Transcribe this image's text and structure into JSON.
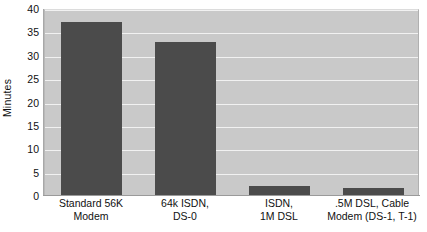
{
  "chart_data": {
    "type": "bar",
    "title": "",
    "xlabel": "",
    "ylabel": "Minutes",
    "ylim": [
      0,
      40
    ],
    "ytick_step": 5,
    "yticks": [
      40,
      35,
      30,
      25,
      20,
      15,
      10,
      5,
      0
    ],
    "grid": true,
    "legend": "none",
    "categories": [
      "Standard 56K Modem",
      "64k ISDN, DS-0",
      "ISDN, 1M DSL",
      ".5M DSL, Cable Modem (DS-1, T-1)"
    ],
    "category_lines": [
      [
        "Standard 56K",
        "Modem"
      ],
      [
        "64k ISDN,",
        "DS-0"
      ],
      [
        "ISDN,",
        "1M DSL"
      ],
      [
        ".5M DSL, Cable",
        "Modem (DS-1, T-1)"
      ]
    ],
    "values": [
      37.2,
      32.9,
      2.2,
      1.7
    ],
    "bar_color": "#4b4b4b",
    "plot_background": "#c9c9c9",
    "gridline_color": "#f1f1f1",
    "page_background": "#ffffff"
  }
}
